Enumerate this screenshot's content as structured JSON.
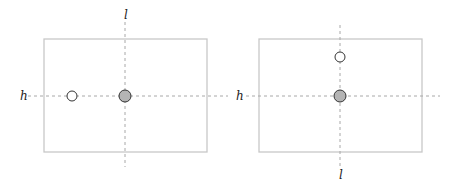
{
  "colors": {
    "frame": "#c8c8c8",
    "axis": "#a8a8a8",
    "filled_point": "#b4b4b4",
    "hollow_point": "#ffffff",
    "point_stroke": "#333333",
    "label": "#222222"
  },
  "panels": [
    {
      "name": "left",
      "rect": {
        "x": 44,
        "y": 39,
        "w": 163,
        "h": 113
      },
      "h_line": {
        "x1": 28,
        "x2": 228,
        "y": 96,
        "label": "h",
        "label_pos": [
          20,
          100
        ]
      },
      "l_line": {
        "x": 125,
        "y1": 22,
        "y2": 167,
        "label": "l",
        "label_pos": [
          124,
          19
        ]
      },
      "points": [
        {
          "kind": "hollow",
          "cx": 72,
          "cy": 96,
          "r": 5
        },
        {
          "kind": "filled",
          "cx": 125,
          "cy": 96,
          "r": 6
        }
      ]
    },
    {
      "name": "right",
      "rect": {
        "x": 259,
        "y": 39,
        "w": 163,
        "h": 113
      },
      "h_line": {
        "x1": 246,
        "x2": 440,
        "y": 96,
        "label": "h",
        "label_pos": [
          236,
          100
        ]
      },
      "l_line": {
        "x": 340,
        "y1": 25,
        "y2": 168,
        "label": "l",
        "label_pos": [
          339,
          179
        ]
      },
      "points": [
        {
          "kind": "hollow",
          "cx": 340,
          "cy": 57,
          "r": 5
        },
        {
          "kind": "filled",
          "cx": 340,
          "cy": 96,
          "r": 6
        }
      ]
    }
  ]
}
